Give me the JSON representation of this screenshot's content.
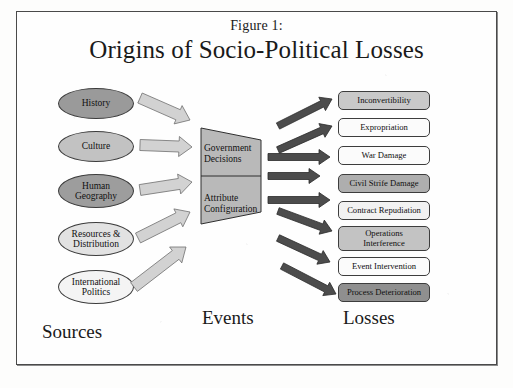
{
  "figure": {
    "label": "Figure 1:",
    "title": "Origins of Socio-Political Losses",
    "frame_border_color": "#4a4a4a",
    "background_color": "#fefefe"
  },
  "columns": [
    {
      "name": "sources",
      "caption": "Sources"
    },
    {
      "name": "events",
      "caption": "Events"
    },
    {
      "name": "losses",
      "caption": "Losses"
    }
  ],
  "sources": {
    "shape": "ellipse",
    "items": [
      {
        "lines": [
          "History"
        ],
        "fill": "#9a9a9a",
        "x": 58,
        "y": 88
      },
      {
        "lines": [
          "Culture"
        ],
        "fill": "#c2c2c2",
        "x": 58,
        "y": 131
      },
      {
        "lines": [
          "Human",
          "Geography"
        ],
        "fill": "#9d9d9d",
        "x": 58,
        "y": 174
      },
      {
        "lines": [
          "Resources &",
          "Distribution"
        ],
        "fill": "#e2e2e2",
        "x": 58,
        "y": 222
      },
      {
        "lines": [
          "International",
          "Politics"
        ],
        "fill": "#f4f4f4",
        "x": 58,
        "y": 270
      }
    ]
  },
  "events": {
    "shape": "trapezoid",
    "fill": "#b9b9b9",
    "stroke": "#2f2f2f",
    "segments": [
      {
        "name": "government-decisions",
        "lines": [
          "Government",
          "Decisions"
        ]
      },
      {
        "name": "attribute-configuration",
        "lines": [
          "Attribute",
          "Configuration"
        ]
      }
    ]
  },
  "losses": {
    "shape": "rounded-rectangle",
    "items": [
      {
        "lines": [
          "Inconvertibility"
        ],
        "fill": "#c9c9c9",
        "y": 91,
        "h": 19
      },
      {
        "lines": [
          "Expropriation"
        ],
        "fill": "#fbfbfb",
        "y": 118,
        "h": 19
      },
      {
        "lines": [
          "War Damage"
        ],
        "fill": "#fbfbfb",
        "y": 146,
        "h": 19
      },
      {
        "lines": [
          "Civil Strife Damage"
        ],
        "fill": "#aeaeae",
        "y": 174,
        "h": 19
      },
      {
        "lines": [
          "Contract Repudiation"
        ],
        "fill": "#f2f2f2",
        "y": 201,
        "h": 19
      },
      {
        "lines": [
          "Operations",
          "Interference"
        ],
        "fill": "#c3c3c3",
        "y": 226,
        "h": 25
      },
      {
        "lines": [
          "Event Intervention"
        ],
        "fill": "#fbfbfb",
        "y": 257,
        "h": 19
      },
      {
        "lines": [
          "Process Deterioration"
        ],
        "fill": "#8f8f8f",
        "y": 283,
        "h": 19
      }
    ]
  },
  "arrows": {
    "source_to_event": {
      "name": "light-arrow",
      "fill": "#d2d2d2",
      "stroke": "#6f6f6f",
      "count": 5
    },
    "event_to_loss": {
      "name": "dark-arrow",
      "fill": "#4c4c4c",
      "stroke": "#2a2a2a",
      "count": 8
    }
  }
}
